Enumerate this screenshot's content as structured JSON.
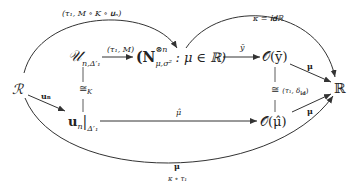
{
  "diagram": {
    "type": "commutative-diagram",
    "nodes": {
      "R_cal": "ℛ",
      "U_n": "𝒰",
      "U_n_sub": "n,Δ′₁",
      "N_family": "(𝐍",
      "N_sup": "⊗n",
      "N_sub": "μ,σ²",
      "N_rest": ": μ ∈ ℝ)",
      "O_ybar": "𝒪(ȳ)",
      "R_bb": "ℝ",
      "u_restr": "𝐮",
      "u_restr_sub": "n",
      "u_restr_bar": "|",
      "u_restr_sub2": "Δ′₁",
      "O_muhat": "𝒪(μ̂)"
    },
    "arrows": {
      "top_arc": "(τ₁, M ∘ K ∘ 𝐮ₙ)",
      "top_right_arc": "κ = 𝐢𝐝ℝ",
      "U_to_N": "(τ₁, M)",
      "N_to_O": "ȳ",
      "O_to_R_upper": "μ",
      "R_to_u": "𝐮ₙ",
      "iso_left": "≅",
      "iso_left_sub": "K",
      "iso_right": "≅",
      "iso_right_label": "(τ₁, δ",
      "iso_right_label_sub": "id",
      "iso_right_label_end": ")",
      "u_to_Omu": "μ̂",
      "Omu_to_R": "μ",
      "bottom_arc_top": "μ",
      "bottom_arc_bottom": "κ ∘ τ₁"
    }
  }
}
